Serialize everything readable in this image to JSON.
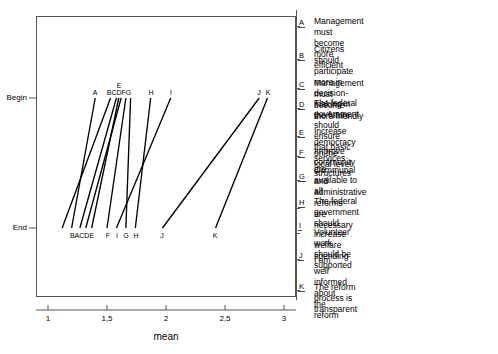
{
  "chart_data": {
    "type": "line",
    "title": "",
    "xlabel": "mean",
    "ylabel": "",
    "xticks": [
      "1",
      "1,5",
      "2",
      "2,5",
      "3"
    ],
    "xtick_values": [
      1,
      1.5,
      2,
      2.5,
      3
    ],
    "xlim": [
      0.9,
      3.1
    ],
    "yticks": [
      "Begin",
      "End"
    ],
    "grid": false,
    "legend_position": "right",
    "series": [
      {
        "name": "A",
        "label_top": "A",
        "label_bottom": "A",
        "begin": 1.4,
        "end": 1.2
      },
      {
        "name": "B",
        "label_top": "B",
        "label_bottom": "B",
        "begin": 1.53,
        "end": 1.12
      },
      {
        "name": "C",
        "label_top": "C",
        "label_bottom": "C",
        "begin": 1.58,
        "end": 1.27
      },
      {
        "name": "D",
        "label_top": "D",
        "label_bottom": "D",
        "begin": 1.62,
        "end": 1.32
      },
      {
        "name": "E",
        "label_top": "E",
        "label_bottom": "E",
        "begin": 1.6,
        "end": 1.37
      },
      {
        "name": "F",
        "label_top": "F",
        "label_bottom": "F",
        "begin": 1.66,
        "end": 1.5
      },
      {
        "name": "G",
        "label_top": "G",
        "label_bottom": "G",
        "begin": 1.7,
        "end": 1.66
      },
      {
        "name": "H",
        "label_top": "H",
        "label_bottom": "H",
        "begin": 1.87,
        "end": 1.74
      },
      {
        "name": "I",
        "label_top": "I",
        "label_bottom": "I",
        "begin": 2.04,
        "end": 1.58
      },
      {
        "name": "J",
        "label_top": "J",
        "label_bottom": "J",
        "begin": 2.79,
        "end": 1.97
      },
      {
        "name": "K",
        "label_top": "K",
        "label_bottom": "K",
        "begin": 2.86,
        "end": 2.42
      }
    ],
    "top_label_groups": [
      {
        "text": "A",
        "x": 1.4
      },
      {
        "text": "E",
        "x": 1.6
      },
      {
        "text": "BCDFG",
        "x": 1.62
      },
      {
        "text": "H",
        "x": 1.87
      },
      {
        "text": "I",
        "x": 2.04
      },
      {
        "text": "J",
        "x": 2.79
      },
      {
        "text": "K",
        "x": 2.88
      }
    ],
    "bottom_label_groups": [
      {
        "text": "BACDE",
        "x": 1.245
      },
      {
        "text": "F",
        "x": 1.5
      },
      {
        "text": "I",
        "x": 1.58
      },
      {
        "text": "G",
        "x": 1.66
      },
      {
        "text": "H",
        "x": 1.74
      },
      {
        "text": "J",
        "x": 1.97
      },
      {
        "text": "K",
        "x": 2.42
      }
    ],
    "colors": {
      "line": "#000000",
      "frame": "#555555",
      "text": "#000000"
    }
  },
  "axis": {
    "x_title": "mean",
    "y_top_label": "Begin",
    "y_bottom_label": "End"
  },
  "legend": {
    "items": [
      {
        "key": "A",
        "text": "Management must become more efficient"
      },
      {
        "key": "B",
        "text": "Citizens should participate more in\ndecision-making in the future"
      },
      {
        "key": "C",
        "text": "Management must become more friendly"
      },
      {
        "key": "D",
        "text": "The federal government should ensure\nthat basic services are available to all"
      },
      {
        "key": "E",
        "text": "Increase democracy on the local level"
      },
      {
        "key": "F",
        "text": "Improve community structures"
      },
      {
        "key": "G",
        "text": "Communal and administrative reforms\nare necessary"
      },
      {
        "key": "H",
        "text": "The federal government should increase\nwelfare spending"
      },
      {
        "key": "I",
        "text": "Volunteer work should be supported"
      },
      {
        "key": "J",
        "text": "I am well informed about the reform"
      },
      {
        "key": "K",
        "text": "The reform process is transparent"
      }
    ]
  }
}
